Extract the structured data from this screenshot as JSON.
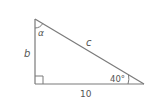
{
  "diagram": {
    "type": "right-triangle",
    "vertices": {
      "top": [
        35,
        19
      ],
      "right_angle": [
        35,
        84
      ],
      "right": [
        144,
        84
      ]
    },
    "sides": {
      "vertical": {
        "label": "b"
      },
      "hypotenuse": {
        "label": "c"
      },
      "horizontal": {
        "label": "10"
      }
    },
    "angles": {
      "top": {
        "label": "α"
      },
      "right": {
        "label": "40°"
      },
      "corner": {
        "label": "right angle"
      }
    },
    "colors": {
      "stroke": "#7a7a7a",
      "text": "#555555"
    }
  }
}
